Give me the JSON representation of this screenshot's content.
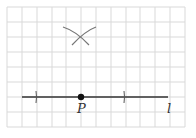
{
  "diagram": {
    "type": "geometric-construction",
    "grid": {
      "x0": 7,
      "y0": 7,
      "spacing": 14.75,
      "cols": 12,
      "rows": 8,
      "color": "#d9d9d9"
    },
    "line": {
      "label": "l",
      "x1": 22,
      "x2": 168,
      "y": 97,
      "color": "#333333"
    },
    "point": {
      "label": "P",
      "x": 81,
      "y": 97
    },
    "ticks": [
      {
        "x": 36
      },
      {
        "x": 124
      }
    ],
    "arcs_intersection": {
      "x": 81,
      "y": 37
    },
    "labels": {
      "point": "P",
      "line": "l"
    }
  }
}
